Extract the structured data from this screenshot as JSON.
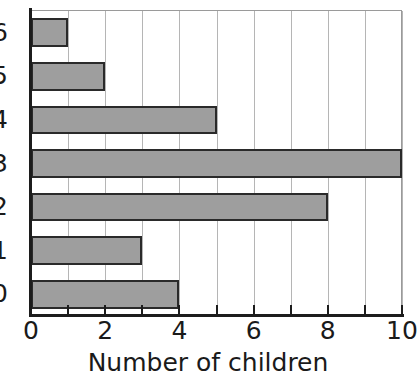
{
  "chart_data": {
    "type": "bar",
    "orientation": "horizontal",
    "title": "",
    "xlabel": "Number of children",
    "ylabel": "",
    "categories": [
      "0",
      "1",
      "2",
      "3",
      "4",
      "5",
      "6"
    ],
    "values": [
      4,
      3,
      8,
      10,
      5,
      2,
      1
    ],
    "xlim": [
      0,
      10
    ],
    "xticks": [
      0,
      1,
      2,
      3,
      4,
      5,
      6,
      7,
      8,
      9,
      10
    ],
    "xtick_labels": [
      "0",
      "",
      "2",
      "",
      "4",
      "",
      "6",
      "",
      "8",
      "",
      "10"
    ],
    "ytick_labels_top_to_bottom": [
      "6",
      "5",
      "4",
      "3",
      "2",
      "1",
      "0"
    ],
    "grid": "vertical",
    "legend": "none",
    "bar_fill_color": "#9e9e9e",
    "bar_edge_color": "#2a2a2a",
    "gridline_color": "#b5b5b5",
    "axis_color": "#1c1c1c"
  }
}
